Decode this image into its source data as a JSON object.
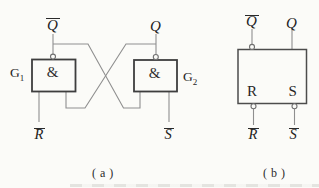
{
  "colors": {
    "background": "#fbfbf8",
    "wire": "#8f8f8f",
    "gate_border": "#3e3e3e",
    "block_border": "#4c4c4c",
    "bubble_border": "#707070",
    "text": "#222222"
  },
  "diagram_a": {
    "caption": "( a )",
    "gate1_label": {
      "base": "G",
      "sub": "1"
    },
    "gate2_label": {
      "base": "G",
      "sub": "2"
    },
    "gate1_symbol": "&",
    "gate2_symbol": "&",
    "q_bar_output": "Q",
    "q_output": "Q",
    "r_bar_input": "R",
    "s_bar_input": "S"
  },
  "diagram_b": {
    "caption": "( b )",
    "q_bar_output": "Q",
    "q_output": "Q",
    "r_port": "R",
    "s_port": "S",
    "r_bar_input": "R",
    "s_bar_input": "S"
  }
}
